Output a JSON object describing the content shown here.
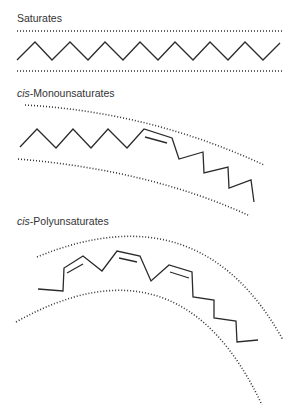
{
  "diagram": {
    "sections": [
      {
        "id": "saturates",
        "prefix": "",
        "name": "Saturates",
        "shape": "straight zigzag chain between two straight dotted boundaries"
      },
      {
        "id": "mono",
        "prefix": "cis",
        "name": "-Monounsaturates",
        "shape": "chain with one cis double bond, bent, between curved dotted boundaries"
      },
      {
        "id": "poly",
        "prefix": "cis",
        "name": "-Polyunsaturates",
        "shape": "chain with three cis double bonds, strongly curved, between curved dotted boundaries"
      }
    ]
  }
}
